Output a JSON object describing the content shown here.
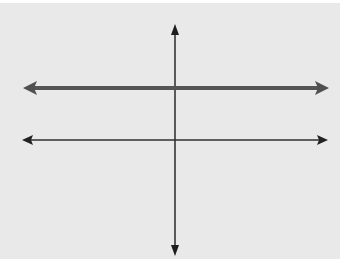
{
  "diagram": {
    "background_color": "#e9e9e9",
    "elements": [
      {
        "id": "vertical-line",
        "type": "line",
        "x1": 175,
        "y1": 24,
        "x2": 175,
        "y2": 256,
        "stroke": "#2a2a2a",
        "width": 1.5,
        "arrows": "both"
      },
      {
        "id": "thick-horizontal-line",
        "type": "line",
        "x1": 23,
        "y1": 88,
        "x2": 329,
        "y2": 88,
        "stroke": "#555555",
        "width": 4,
        "arrows": "both"
      },
      {
        "id": "thin-horizontal-line",
        "type": "line",
        "x1": 22,
        "y1": 140,
        "x2": 328,
        "y2": 140,
        "stroke": "#2f2f2f",
        "width": 1.5,
        "arrows": "both"
      }
    ]
  }
}
